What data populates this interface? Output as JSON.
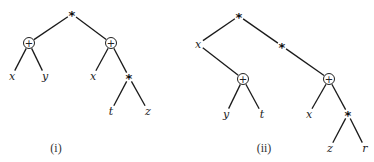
{
  "figure": {
    "trees": [
      {
        "caption": "(i)",
        "caption_pos": [
          56,
          152
        ],
        "nodes": [
          {
            "id": "r",
            "label": "*",
            "kind": "op-star",
            "x": 72,
            "y": 14
          },
          {
            "id": "p1",
            "label": "+",
            "kind": "op-plus",
            "x": 29,
            "y": 43
          },
          {
            "id": "p2",
            "label": "+",
            "kind": "op-plus",
            "x": 111,
            "y": 43
          },
          {
            "id": "x1",
            "label": "x",
            "kind": "leaf",
            "x": 12,
            "y": 76
          },
          {
            "id": "y1",
            "label": "y",
            "kind": "leaf",
            "x": 45,
            "y": 76
          },
          {
            "id": "x2",
            "label": "x",
            "kind": "leaf",
            "x": 93,
            "y": 76
          },
          {
            "id": "s2",
            "label": "*",
            "kind": "op-star",
            "x": 129,
            "y": 77
          },
          {
            "id": "t1",
            "label": "t",
            "kind": "leaf",
            "x": 111,
            "y": 111
          },
          {
            "id": "z1",
            "label": "z",
            "kind": "leaf",
            "x": 148,
            "y": 111
          }
        ],
        "edges": [
          [
            "r",
            "p1"
          ],
          [
            "r",
            "p2"
          ],
          [
            "p1",
            "x1"
          ],
          [
            "p1",
            "y1"
          ],
          [
            "p2",
            "x2"
          ],
          [
            "p2",
            "s2"
          ],
          [
            "s2",
            "t1"
          ],
          [
            "s2",
            "z1"
          ]
        ]
      },
      {
        "caption": "(ii)",
        "caption_pos": [
          264,
          152
        ],
        "nodes": [
          {
            "id": "r",
            "label": "*",
            "kind": "op-star",
            "x": 239,
            "y": 16
          },
          {
            "id": "xa",
            "label": "x",
            "kind": "leaf",
            "x": 198,
            "y": 44
          },
          {
            "id": "s2",
            "label": "*",
            "kind": "op-star",
            "x": 282,
            "y": 46
          },
          {
            "id": "p1",
            "label": "+",
            "kind": "op-plus",
            "x": 243,
            "y": 79
          },
          {
            "id": "y1",
            "label": "y",
            "kind": "leaf",
            "x": 226,
            "y": 114
          },
          {
            "id": "t1",
            "label": "t",
            "kind": "leaf",
            "x": 262,
            "y": 114
          },
          {
            "id": "p2",
            "label": "+",
            "kind": "op-plus",
            "x": 329,
            "y": 79
          },
          {
            "id": "x2",
            "label": "x",
            "kind": "leaf",
            "x": 309,
            "y": 114
          },
          {
            "id": "s3",
            "label": "*",
            "kind": "op-star",
            "x": 348,
            "y": 114
          },
          {
            "id": "z1",
            "label": "z",
            "kind": "leaf",
            "x": 330,
            "y": 148
          },
          {
            "id": "r1",
            "label": "r",
            "kind": "leaf",
            "x": 365,
            "y": 148
          }
        ],
        "edges": [
          [
            "r",
            "xa"
          ],
          [
            "r",
            "s2"
          ],
          [
            "xa",
            "p1"
          ],
          [
            "p1",
            "y1"
          ],
          [
            "p1",
            "t1"
          ],
          [
            "s2",
            "p2"
          ],
          [
            "p2",
            "x2"
          ],
          [
            "p2",
            "s3"
          ],
          [
            "s3",
            "z1"
          ],
          [
            "s3",
            "r1"
          ]
        ]
      }
    ]
  }
}
